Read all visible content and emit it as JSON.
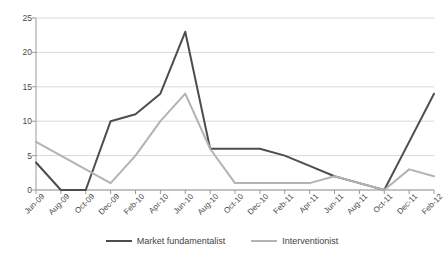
{
  "chart_data": {
    "type": "line",
    "title": "",
    "subtitle": "",
    "xlabel": "",
    "ylabel": "",
    "ylim": [
      0,
      25
    ],
    "yticks": [
      0,
      5,
      10,
      15,
      20,
      25
    ],
    "grid": true,
    "legend_position": "bottom",
    "categories": [
      "Jun-09",
      "Aug-09",
      "Oct-09",
      "Dec-09",
      "Feb-10",
      "Apr-10",
      "Jun-10",
      "Aug-10",
      "Oct-10",
      "Dec-10",
      "Feb-11",
      "Apr-11",
      "Jun-11",
      "Aug-11",
      "Oct-11",
      "Dec-11",
      "Feb-12"
    ],
    "series": [
      {
        "name": "Market fundamentalist",
        "color": "#4d4d4d",
        "width": 2,
        "values": [
          4,
          0,
          0,
          10,
          11,
          14,
          23,
          6,
          6,
          6,
          5,
          3.5,
          2,
          1,
          0,
          7,
          14
        ]
      },
      {
        "name": "Interventionist",
        "color": "#b3b3b3",
        "width": 2,
        "values": [
          7,
          5,
          3,
          1,
          5,
          10,
          14,
          6,
          1,
          1,
          1,
          1,
          2,
          1,
          0,
          3,
          2
        ]
      }
    ]
  },
  "axis": {
    "y_tick_labels": [
      "0",
      "5",
      "10",
      "15",
      "20",
      "25"
    ],
    "x_tick_labels": [
      "Jun-09",
      "Aug-09",
      "Oct-09",
      "Dec-09",
      "Feb-10",
      "Apr-10",
      "Jun-10",
      "Aug-10",
      "Oct-10",
      "Dec-10",
      "Feb-11",
      "Apr-11",
      "Jun-11",
      "Aug-11",
      "Oct-11",
      "Dec-11",
      "Feb-12"
    ]
  },
  "legend": {
    "items": [
      {
        "label": "Market fundamentalist",
        "swatch": "dark"
      },
      {
        "label": "Interventionist",
        "swatch": "light"
      }
    ]
  },
  "colors": {
    "series_dark": "#4d4d4d",
    "series_light": "#b3b3b3",
    "gridline": "#d9d9d9",
    "axis": "#9a9a9a",
    "text": "#3f3f3f",
    "background": "#ffffff"
  }
}
